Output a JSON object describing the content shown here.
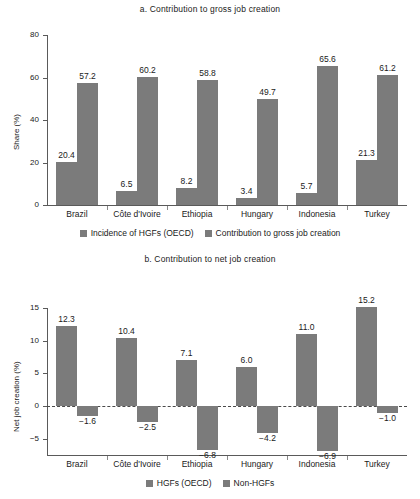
{
  "figure": {
    "background": "#ffffff",
    "bar_color": "#7b7b7b",
    "axis_color": "#5a5a5a"
  },
  "chart_data": [
    {
      "type": "bar",
      "title": "a. Contribution to gross job creation",
      "xlabel": "",
      "ylabel": "Share (%)",
      "ylim": [
        0,
        80
      ],
      "yticks": [
        0,
        20,
        40,
        60,
        80
      ],
      "ytick_labels": [
        "0",
        "20",
        "40",
        "60",
        "80"
      ],
      "grid": false,
      "legend_position": "bottom",
      "categories": [
        "Brazil",
        "Côte d'Ivoire",
        "Ethiopia",
        "Hungary",
        "Indonesia",
        "Turkey"
      ],
      "series": [
        {
          "name": "Incidence of HGFs (OECD)",
          "values": [
            20.4,
            6.5,
            8.2,
            3.4,
            5.7,
            21.3
          ],
          "labels": [
            "20.4",
            "6.5",
            "8.2",
            "3.4",
            "5.7",
            "21.3"
          ]
        },
        {
          "name": "Contribution to gross job creation",
          "values": [
            57.2,
            60.2,
            58.8,
            49.7,
            65.6,
            61.2
          ],
          "labels": [
            "57.2",
            "60.2",
            "58.8",
            "49.7",
            "65.6",
            "61.2"
          ]
        }
      ]
    },
    {
      "type": "bar",
      "title": "b. Contribution to net job creation",
      "xlabel": "",
      "ylabel": "Net job creation (%)",
      "ylim": [
        -7.5,
        15
      ],
      "yticks": [
        -5,
        0,
        5,
        10,
        15
      ],
      "ytick_labels": [
        "−5",
        "0",
        "5",
        "10",
        "15"
      ],
      "grid": false,
      "zero_line": true,
      "legend_position": "bottom",
      "categories": [
        "Brazil",
        "Côte d'Ivoire",
        "Ethiopia",
        "Hungary",
        "Indonesia",
        "Turkey"
      ],
      "series": [
        {
          "name": "HGFs (OECD)",
          "values": [
            12.3,
            10.4,
            7.1,
            6.0,
            11.0,
            15.2
          ],
          "labels": [
            "12.3",
            "10.4",
            "7.1",
            "6.0",
            "11.0",
            "15.2"
          ]
        },
        {
          "name": "Non-HGFs",
          "values": [
            -1.6,
            -2.5,
            -6.8,
            -4.2,
            -6.9,
            -1.0
          ],
          "labels": [
            "−1.6",
            "−2.5",
            "−6.8",
            "−4.2",
            "−6.9",
            "−1.0"
          ]
        }
      ]
    }
  ]
}
